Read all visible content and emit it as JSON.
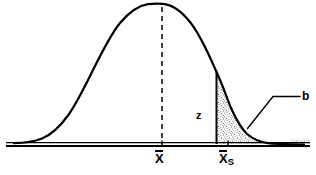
{
  "figure": {
    "kind": "normal-distribution-curve",
    "title": "",
    "background_color": "#ffffff",
    "line_color": "#000000",
    "shading_color": "#000000",
    "labels": {
      "mean": "X",
      "mean_subscript": "",
      "sample_mean": "X",
      "sample_mean_subscript": "S",
      "z_label": "z",
      "beta_label": "b"
    },
    "axis": {
      "baseline_style": "double-rule",
      "tick_positions": [
        "mean",
        "sample_mean"
      ]
    },
    "regions": {
      "shaded_tail": {
        "name": "beta-region",
        "fill": "stipple",
        "starts_at": "sample_mean",
        "extends_to": "right-tail"
      }
    },
    "guides": {
      "mean_line": "dashed-vertical",
      "boundary_line": "solid-vertical",
      "callout_line": "elbow-leader"
    }
  }
}
